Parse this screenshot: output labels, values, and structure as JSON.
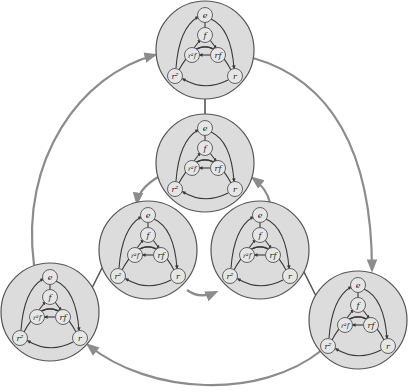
{
  "diagram": {
    "colors": {
      "background": "#ffffff",
      "cluster_fill": "#dcdcdc",
      "cluster_stroke": "#555555",
      "inner_edge": "#3a3a3a",
      "outer_edge": "#8c8c8c",
      "node_fill": "#e6e6e6"
    },
    "node_labels": {
      "e": "e",
      "f": "f",
      "r2f": "r²f",
      "rf": "rf",
      "r2": "r²",
      "r": "r"
    },
    "clusters": [
      {
        "id": "top",
        "cx": 205,
        "cy": 50
      },
      {
        "id": "center",
        "cx": 205,
        "cy": 163
      },
      {
        "id": "mid-left",
        "cx": 148,
        "cy": 250
      },
      {
        "id": "mid-right",
        "cx": 260,
        "cy": 250
      },
      {
        "id": "bottom-left",
        "cx": 50,
        "cy": 312
      },
      {
        "id": "bottom-right",
        "cx": 358,
        "cy": 320
      }
    ],
    "outer_edges": [
      {
        "from": "top",
        "to": "bottom-right",
        "type": "arrow"
      },
      {
        "from": "bottom-right",
        "to": "bottom-left",
        "type": "arrow"
      },
      {
        "from": "bottom-left",
        "to": "top",
        "type": "arrow"
      },
      {
        "from": "center",
        "to": "mid-left",
        "type": "arrow"
      },
      {
        "from": "mid-left",
        "to": "mid-right",
        "type": "arrow"
      },
      {
        "from": "mid-right",
        "to": "center",
        "type": "arrow"
      },
      {
        "from": "top",
        "to": "center",
        "type": "line"
      },
      {
        "from": "mid-left",
        "to": "bottom-left",
        "type": "line"
      },
      {
        "from": "mid-right",
        "to": "bottom-right",
        "type": "line"
      }
    ]
  }
}
